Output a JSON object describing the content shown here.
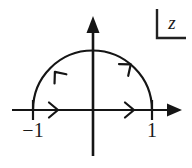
{
  "figure": {
    "plane_label": "z",
    "background_color": "#ffffff",
    "stroke_color": "#151515"
  },
  "axes": {
    "real_axis": {
      "name": "real-axis",
      "x_start": 12,
      "x_end": 181,
      "y": 110,
      "arrow_head": "solid-triangle-right"
    },
    "imaginary_axis": {
      "name": "imaginary-axis",
      "x": 93,
      "y_start": 156,
      "y_end": 17,
      "arrow_head": "solid-triangle-up"
    }
  },
  "ticks": [
    {
      "label": "−1",
      "value": -1,
      "x": 33,
      "y": 110,
      "label_x": 33,
      "label_y": 135
    },
    {
      "label": "1",
      "value": 1,
      "x": 152,
      "y": 110,
      "label_x": 152,
      "label_y": 135
    }
  ],
  "contour": {
    "type": "upper-semicircle",
    "center_x": 92.5,
    "center_y": 110,
    "radius": 59.5,
    "from": -1,
    "to": 1,
    "orientation": "counterclockwise",
    "arc_arrows": [
      {
        "name": "arc-arrow-right",
        "angle_deg": 50,
        "direction": "counterclockwise"
      },
      {
        "name": "arc-arrow-left",
        "angle_deg": 140,
        "direction": "counterclockwise"
      }
    ]
  },
  "segment_arrows": [
    {
      "name": "real-axis-arrow-left",
      "x": 56,
      "y": 110,
      "direction": "right",
      "style": "open-chevron"
    },
    {
      "name": "real-axis-arrow-right",
      "x": 132,
      "y": 110,
      "direction": "right",
      "style": "open-chevron"
    }
  ],
  "plane_marker": {
    "name": "z-plane-corner-bracket",
    "corner_x": 157,
    "corner_y": 38,
    "vertical_top_y": 9,
    "horizontal_right_x": 186,
    "label": "z",
    "label_x": 172,
    "label_y": 27
  }
}
